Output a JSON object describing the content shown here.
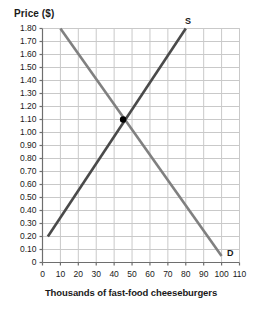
{
  "chart_data": {
    "type": "line",
    "title": "",
    "ylabel": "Price ($)",
    "xlabel": "Thousands of fast-food cheeseburgers",
    "xlim": [
      0,
      110
    ],
    "ylim": [
      0,
      1.8
    ],
    "grid": true,
    "legend_position": "inline-at-curve-ends",
    "x_ticks": [
      "0",
      "10",
      "20",
      "30",
      "40",
      "50",
      "60",
      "70",
      "80",
      "90",
      "100",
      "110"
    ],
    "x_tick_values": [
      0,
      10,
      20,
      30,
      40,
      50,
      60,
      70,
      80,
      90,
      100,
      110
    ],
    "y_ticks": [
      "0",
      "0.10",
      "0.20",
      "0.30",
      "0.40",
      "0.50",
      "0.60",
      "0.70",
      "0.80",
      "0.90",
      "1.00",
      "1.10",
      "1.20",
      "1.30",
      "1.40",
      "1.50",
      "1.60",
      "1.70",
      "1.80"
    ],
    "y_tick_values": [
      0,
      0.1,
      0.2,
      0.3,
      0.4,
      0.5,
      0.6,
      0.7,
      0.8,
      0.9,
      1.0,
      1.1,
      1.2,
      1.3,
      1.4,
      1.5,
      1.6,
      1.7,
      1.8
    ],
    "series": [
      {
        "name": "S",
        "label": "S",
        "description": "Supply curve, upward sloping",
        "color": "#4a4a4a",
        "points": [
          [
            3,
            0.2
          ],
          [
            80,
            1.8
          ]
        ]
      },
      {
        "name": "D",
        "label": "D",
        "description": "Demand curve, downward sloping",
        "color": "#808080",
        "points": [
          [
            10,
            1.8
          ],
          [
            100,
            0.05
          ]
        ]
      }
    ],
    "annotations": [
      {
        "name": "equilibrium-point",
        "type": "point",
        "x": 45,
        "y": 1.1,
        "color": "#000000",
        "label": ""
      }
    ]
  },
  "colors": {
    "supply": "#4a4a4a",
    "demand": "#808080",
    "grid": "#c9c9c9",
    "axis": "#6e6e6e",
    "text": "#1a1a1a",
    "equilibrium": "#000000",
    "background": "#ffffff"
  }
}
